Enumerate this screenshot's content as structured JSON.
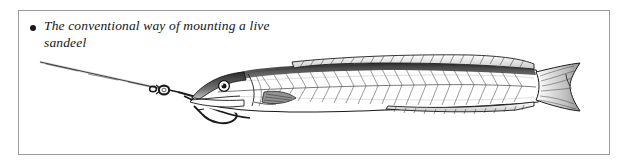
{
  "figure": {
    "width": 628,
    "height": 166,
    "background_color": "#ffffff",
    "border_color": "#9a9a9a",
    "ink_color": "#1a1a1a"
  },
  "caption": {
    "bullet": "•",
    "text": "The conventional way of mounting a live sandeel",
    "style": "italic-serif"
  },
  "illustration": {
    "subject": "sandeel",
    "description": "Pen-and-ink side view of a live sandeel mounted on a single hook with a swivel and leader line",
    "parts": [
      {
        "name": "leader-line",
        "label": "fishing line"
      },
      {
        "name": "swivel-ring",
        "label": "swivel"
      },
      {
        "name": "hook",
        "label": "hook through the jaw"
      },
      {
        "name": "fish-head",
        "label": "head"
      },
      {
        "name": "fish-eye",
        "label": "eye"
      },
      {
        "name": "pectoral-fin",
        "label": "pectoral fin"
      },
      {
        "name": "dorsal-fin",
        "label": "dorsal fin"
      },
      {
        "name": "anal-fin",
        "label": "anal fin"
      },
      {
        "name": "caudal-fin",
        "label": "forked tail fin"
      },
      {
        "name": "body-scales",
        "label": "chevron scale hatching"
      }
    ]
  }
}
